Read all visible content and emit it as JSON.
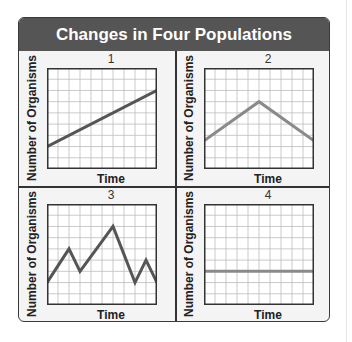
{
  "title": "Changes in Four Populations",
  "chart_data": [
    {
      "type": "line",
      "panel_label": "1",
      "xlabel": "Time",
      "ylabel": "Number of Organisms",
      "grid": true,
      "grid_cols": 10,
      "grid_rows": 9,
      "line_color": "#555555",
      "x": [
        0,
        10
      ],
      "values": [
        2,
        7
      ],
      "description": "steady linear increase"
    },
    {
      "type": "line",
      "panel_label": "2",
      "xlabel": "Time",
      "ylabel": "Number of Organisms",
      "grid": true,
      "grid_cols": 10,
      "grid_rows": 9,
      "line_color": "#8a8a8a",
      "x": [
        0,
        5,
        10
      ],
      "values": [
        2.5,
        6,
        2.5
      ],
      "description": "rise then fall"
    },
    {
      "type": "line",
      "panel_label": "3",
      "xlabel": "Time",
      "ylabel": "Number of Organisms",
      "grid": true,
      "grid_cols": 10,
      "grid_rows": 9,
      "line_color": "#555555",
      "x": [
        0,
        2,
        3,
        6,
        8,
        9,
        10
      ],
      "values": [
        2,
        5,
        3,
        7,
        2,
        4,
        2
      ],
      "description": "fluctuating"
    },
    {
      "type": "line",
      "panel_label": "4",
      "xlabel": "Time",
      "ylabel": "Number of Organisms",
      "grid": true,
      "grid_cols": 10,
      "grid_rows": 9,
      "line_color": "#8a8a8a",
      "x": [
        0,
        10
      ],
      "values": [
        3,
        3
      ],
      "description": "constant"
    }
  ]
}
